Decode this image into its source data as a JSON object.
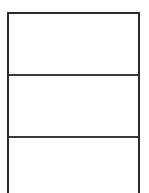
{
  "document": {
    "type": "table",
    "title": "",
    "description": "Empty three-row table outline"
  },
  "canvas": {
    "width": 149,
    "height": 193,
    "background_color": "#ffffff"
  },
  "table": {
    "border_color": "#2a2a2a",
    "divider_color": "#3a3a3a",
    "fill_color": "#ffffff",
    "border_width": 2,
    "column_count": 1,
    "row_count": 3,
    "bottom_edge_cropped": true,
    "columns": [
      {
        "header": ""
      }
    ],
    "rows": [
      {
        "id": "row-1",
        "cells": [
          ""
        ]
      },
      {
        "id": "row-2",
        "cells": [
          ""
        ]
      },
      {
        "id": "row-3",
        "cells": [
          ""
        ]
      }
    ]
  }
}
